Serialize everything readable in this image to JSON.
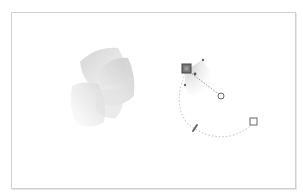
{
  "header": {
    "label": ""
  },
  "canvas": {
    "background": "#ffffff",
    "border_color": "#cfcfcf"
  },
  "artwork": {
    "name": "3d-petal-shape",
    "fill_light": "#f4f4f4",
    "fill_dark": "#cfcfcf"
  },
  "gradient_tool": {
    "name": "radial-gradient-editor",
    "stroke_color": "#b0b0b0",
    "handle_color": "#555555",
    "handles": [
      {
        "id": "start-stop",
        "shape": "square-filled"
      },
      {
        "id": "end-stop",
        "shape": "circle"
      },
      {
        "id": "radius-handle",
        "shape": "square"
      },
      {
        "id": "rotation-handle",
        "shape": "slash"
      }
    ]
  }
}
